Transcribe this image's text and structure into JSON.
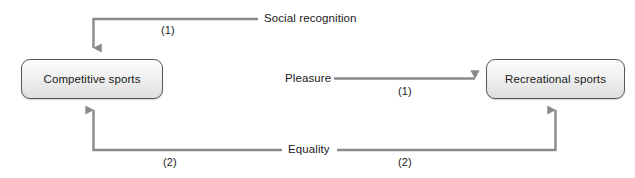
{
  "diagram": {
    "type": "causal-relationship-diagram",
    "background_color": "#ffffff",
    "line_color": "#7a7a7a",
    "box_border_color": "#585858",
    "box_fill_color": "#eeeeee",
    "text_color": "#1a1a1a",
    "nodes": [
      {
        "id": "competitive-sports",
        "label": "Competitive sports",
        "x": 21,
        "y": 59,
        "width": 142,
        "height": 40
      },
      {
        "id": "recreational-sports",
        "label": "Recreational sports",
        "x": 486,
        "y": 59,
        "width": 139,
        "height": 40
      }
    ],
    "edges": [
      {
        "id": "social-recognition",
        "label": "Social recognition",
        "order": "(1)",
        "target": "competitive-sports",
        "arrow_direction": "down"
      },
      {
        "id": "pleasure",
        "label": "Pleasure",
        "order": "(1)",
        "target": "recreational-sports",
        "arrow_direction": "right"
      },
      {
        "id": "equality-left",
        "label": "Equality",
        "order": "(2)",
        "target": "competitive-sports",
        "arrow_direction": "up"
      },
      {
        "id": "equality-right",
        "label": "Equality",
        "order": "(2)",
        "target": "recreational-sports",
        "arrow_direction": "up"
      }
    ]
  },
  "labels": {
    "competitive_sports": "Competitive sports",
    "recreational_sports": "Recreational sports",
    "social_recognition": "Social recognition",
    "pleasure": "Pleasure",
    "equality": "Equality",
    "order_one_top": "(1)",
    "order_one_middle": "(1)",
    "order_two_left": "(2)",
    "order_two_right": "(2)"
  }
}
